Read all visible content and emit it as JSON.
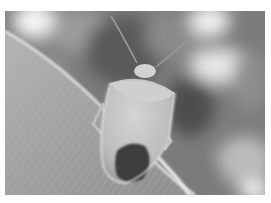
{
  "image": {
    "subject": "stink bug on a leaf",
    "style": "grayscale photograph",
    "colors": {
      "background_dark": "#5a5a5a",
      "background_mid": "#8c8c8c",
      "bokeh_light": "#f2f2f2",
      "leaf": "#a8a8a8",
      "leaf_edge": "#e0e0e0",
      "bug_body": "#c8c8c8",
      "bug_dark_patch": "#3a3a3a",
      "border": "#ffffff"
    }
  }
}
